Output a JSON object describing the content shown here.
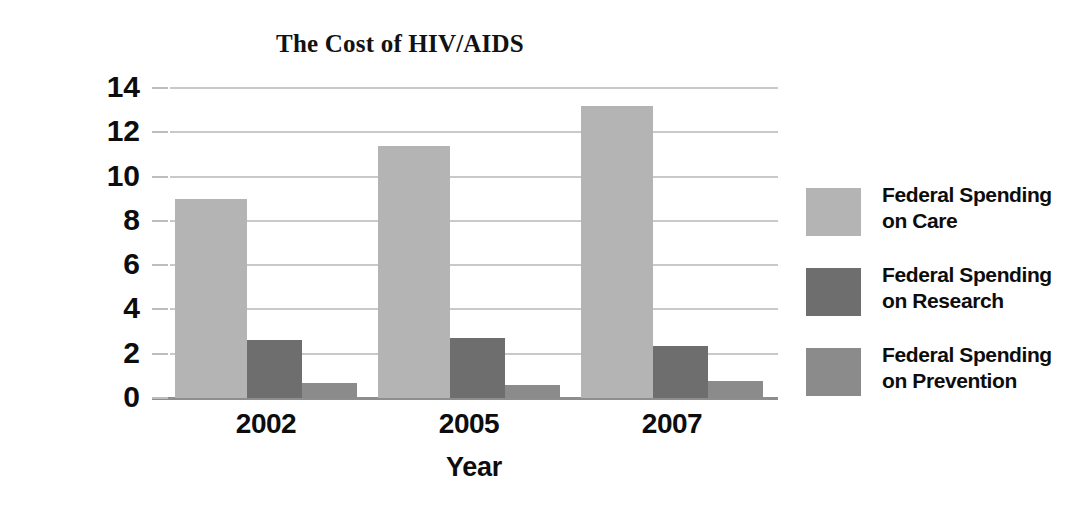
{
  "chart_data": {
    "type": "bar",
    "title": "The Cost of HIV/AIDS",
    "xlabel": "Year",
    "ylabel": "Billions of Dollars",
    "categories": [
      "2002",
      "2005",
      "2007"
    ],
    "series": [
      {
        "name": "Federal Spending on Care",
        "label_line1": "Federal Spending",
        "label_line2": "on Care",
        "color": "#b4b4b4",
        "values": [
          9.0,
          11.4,
          13.2
        ]
      },
      {
        "name": "Federal Spending on Research",
        "label_line1": "Federal Spending",
        "label_line2": "on Research",
        "color": "#6e6e6e",
        "values": [
          2.6,
          2.7,
          2.35
        ]
      },
      {
        "name": "Federal Spending on Prevention",
        "label_line1": "Federal Spending",
        "label_line2": "on Prevention",
        "color": "#8b8b8b",
        "values": [
          0.7,
          0.6,
          0.75
        ]
      }
    ],
    "ylim": [
      0,
      14
    ],
    "ytick_values": [
      14,
      12,
      10,
      8,
      6,
      4,
      2,
      0
    ],
    "ytick_labels": [
      "14",
      "12",
      "10",
      "8",
      "6",
      "4",
      "2",
      "0"
    ],
    "grid": true,
    "legend_position": "right",
    "background_color": "#ffffff",
    "gridline_color": "#c9c9c9",
    "text_color": "#0d0d0d"
  }
}
